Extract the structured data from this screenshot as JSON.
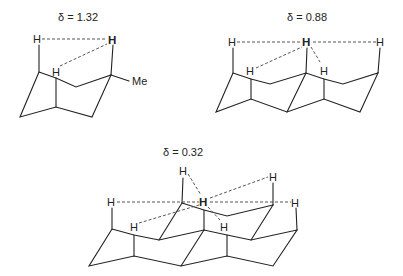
{
  "figure": {
    "structures": [
      {
        "id": "s1",
        "shift_label": "δ = 1.32",
        "substituent": "Me"
      },
      {
        "id": "s2",
        "shift_label": "δ = 0.88"
      },
      {
        "id": "s3",
        "shift_label": "δ = 0.32"
      }
    ],
    "atom_label": "H",
    "highlight_color": "#222222",
    "dash_color": "#555555"
  }
}
